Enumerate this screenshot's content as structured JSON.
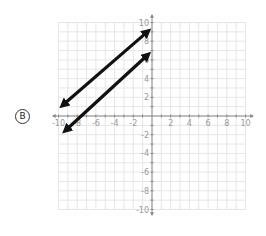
{
  "choice": {
    "label": "B"
  },
  "chart_data": {
    "type": "line",
    "title": "",
    "xlabel": "",
    "ylabel": "",
    "xlim": [
      -10,
      10
    ],
    "ylim": [
      -10,
      10
    ],
    "grid": true,
    "x_ticks": [
      -10,
      -8,
      -6,
      -4,
      -2,
      2,
      4,
      6,
      8,
      10
    ],
    "y_ticks": [
      -10,
      -8,
      -6,
      -4,
      -2,
      2,
      4,
      6,
      8,
      10
    ],
    "x_tick_labels": [
      "-10",
      "-8",
      "-6",
      "-4",
      "-2",
      "2",
      "4",
      "6",
      "8",
      "10"
    ],
    "y_tick_labels": [
      "10",
      "8",
      "6",
      "4",
      "2",
      "-2",
      "-4",
      "-6",
      "-8",
      "-10"
    ],
    "series": [
      {
        "name": "upper line",
        "style": "double-arrow",
        "color": "#111111",
        "points": [
          [
            -9.5,
            1.2
          ],
          [
            -0.5,
            9
          ]
        ]
      },
      {
        "name": "lower line",
        "style": "double-arrow",
        "color": "#111111",
        "points": [
          [
            -9.2,
            -1.5
          ],
          [
            -0.5,
            6.5
          ]
        ]
      }
    ]
  }
}
